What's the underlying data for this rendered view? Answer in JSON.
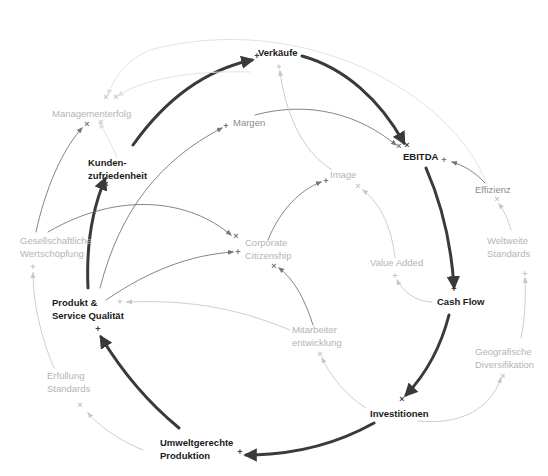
{
  "diagram": {
    "type": "causal-loop-diagram",
    "width": 548,
    "height": 476,
    "colors": {
      "strong": "#3a3a3a",
      "strong_text": "#1a1a1a",
      "medium": "#777777",
      "medium_text": "#8a8a8a",
      "light": "#c8c8c8",
      "light_text": "#b4b4b4",
      "faint": "#e2e2e2"
    },
    "nodes": [
      {
        "id": "verkaeufe",
        "lines": [
          "Verkäufe"
        ],
        "x": 258,
        "y": 56,
        "anchor": "start",
        "weight": "strong"
      },
      {
        "id": "managementerfolg",
        "lines": [
          "Managementerfolg"
        ],
        "x": 52,
        "y": 117,
        "anchor": "start",
        "weight": "light"
      },
      {
        "id": "margen",
        "lines": [
          "Margen"
        ],
        "x": 233,
        "y": 126,
        "anchor": "start",
        "weight": "medium"
      },
      {
        "id": "kundenzufriedenheit",
        "lines": [
          "Kunden-",
          "zufriedenheit"
        ],
        "x": 88,
        "y": 166,
        "anchor": "start",
        "weight": "strong"
      },
      {
        "id": "ebitda",
        "lines": [
          "EBITDA"
        ],
        "x": 403,
        "y": 160,
        "anchor": "start",
        "weight": "strong"
      },
      {
        "id": "image",
        "lines": [
          "Image"
        ],
        "x": 330,
        "y": 178,
        "anchor": "start",
        "weight": "light"
      },
      {
        "id": "effizienz",
        "lines": [
          "Effizienz"
        ],
        "x": 475,
        "y": 193,
        "anchor": "start",
        "weight": "medium"
      },
      {
        "id": "gesellschaftliche",
        "lines": [
          "Gesellschaftliche",
          "Wertschöpfung"
        ],
        "x": 20,
        "y": 244,
        "anchor": "start",
        "weight": "light"
      },
      {
        "id": "corporate",
        "lines": [
          "Corporate",
          "Citizenship"
        ],
        "x": 245,
        "y": 246,
        "anchor": "start",
        "weight": "light"
      },
      {
        "id": "weltweite",
        "lines": [
          "Weltweite",
          "Standards"
        ],
        "x": 487,
        "y": 244,
        "anchor": "start",
        "weight": "light"
      },
      {
        "id": "valueadded",
        "lines": [
          "Value Added"
        ],
        "x": 370,
        "y": 266,
        "anchor": "start",
        "weight": "light"
      },
      {
        "id": "cashflow",
        "lines": [
          "Cash Flow"
        ],
        "x": 437,
        "y": 305,
        "anchor": "start",
        "weight": "strong"
      },
      {
        "id": "produkt",
        "lines": [
          "Produkt &",
          "Service Qualität"
        ],
        "x": 52,
        "y": 306,
        "anchor": "start",
        "weight": "strong"
      },
      {
        "id": "mitarbeiter",
        "lines": [
          "Mitarbeiter",
          "entwicklung"
        ],
        "x": 292,
        "y": 333,
        "anchor": "start",
        "weight": "light"
      },
      {
        "id": "geografische",
        "lines": [
          "Geografische",
          "Diversifikation"
        ],
        "x": 475,
        "y": 355,
        "anchor": "start",
        "weight": "light"
      },
      {
        "id": "erfuellung",
        "lines": [
          "Erfüllung",
          "Standards"
        ],
        "x": 47,
        "y": 379,
        "anchor": "start",
        "weight": "light"
      },
      {
        "id": "investitionen",
        "lines": [
          "Investitionen"
        ],
        "x": 370,
        "y": 417,
        "anchor": "start",
        "weight": "strong"
      },
      {
        "id": "umweltgerechte",
        "lines": [
          "Umweltgerechte",
          "Produktion"
        ],
        "x": 160,
        "y": 446,
        "anchor": "start",
        "weight": "strong"
      }
    ],
    "edges": [
      {
        "from": "kundenzufriedenheit",
        "to": "verkaeufe",
        "weight": "strong",
        "polarity": "+",
        "d": "M133,145 C165,100 205,70 252,60",
        "mx": 257,
        "my": 56
      },
      {
        "from": "verkaeufe",
        "to": "ebitda",
        "weight": "strong",
        "polarity": "×",
        "d": "M302,56 C345,68 380,100 404,143",
        "mx": 407,
        "my": 145
      },
      {
        "from": "ebitda",
        "to": "cashflow",
        "weight": "strong",
        "polarity": "+",
        "d": "M426,168 C440,200 451,240 454,287",
        "mx": 454,
        "my": 289
      },
      {
        "from": "cashflow",
        "to": "investitionen",
        "weight": "strong",
        "polarity": "×",
        "d": "M449,315 C440,350 425,375 406,395",
        "mx": 402,
        "my": 399
      },
      {
        "from": "investitionen",
        "to": "umweltgerechte",
        "weight": "strong",
        "polarity": "+",
        "d": "M374,423 C340,442 300,455 246,455",
        "mx": 240,
        "my": 452
      },
      {
        "from": "umweltgerechte",
        "to": "produkt",
        "weight": "strong",
        "polarity": "+",
        "d": "M179,428 C145,400 118,365 101,337",
        "mx": 98,
        "my": 329
      },
      {
        "from": "produkt",
        "to": "kundenzufriedenheit",
        "weight": "strong",
        "polarity": "×",
        "d": "M88,288 C86,245 92,210 105,179",
        "mx": 106,
        "my": 184
      },
      {
        "from": "produkt",
        "to": "margen",
        "weight": "medium",
        "polarity": "+",
        "d": "M100,288 C120,210 160,160 222,128",
        "mx": 226,
        "my": 126
      },
      {
        "from": "margen",
        "to": "ebitda",
        "weight": "medium",
        "polarity": "×",
        "d": "M255,115 C310,100 360,115 396,145",
        "mx": 399,
        "my": 146
      },
      {
        "from": "produkt",
        "to": "corporate",
        "weight": "medium",
        "polarity": "+",
        "d": "M106,300 C150,270 190,255 233,252",
        "mx": 238,
        "my": 252
      },
      {
        "from": "gesellschaftliche",
        "to": "corporate",
        "weight": "medium",
        "polarity": "×",
        "d": "M48,232 C120,190 190,200 231,235",
        "mx": 236,
        "my": 236
      },
      {
        "from": "corporate",
        "to": "image",
        "weight": "medium",
        "polarity": "+",
        "d": "M268,240 C280,210 300,190 321,182",
        "mx": 326,
        "my": 181
      },
      {
        "from": "mitarbeiter",
        "to": "corporate",
        "weight": "medium",
        "polarity": "×",
        "d": "M313,325 C305,300 295,280 279,268",
        "mx": 274,
        "my": 266
      },
      {
        "from": "mitarbeiter",
        "to": "produkt",
        "weight": "light",
        "polarity": "+",
        "d": "M290,330 C230,305 180,300 127,302",
        "mx": 120,
        "my": 302
      },
      {
        "from": "effizienz",
        "to": "ebitda",
        "weight": "medium",
        "polarity": "+",
        "d": "M485,183 C475,172 463,165 452,162",
        "mx": 444,
        "my": 160
      },
      {
        "from": "weltweite",
        "to": "effizienz",
        "weight": "light",
        "polarity": "×",
        "d": "M511,230 C508,220 505,212 499,204",
        "mx": 497,
        "my": 199
      },
      {
        "from": "geografische",
        "to": "weltweite",
        "weight": "light",
        "polarity": "+",
        "d": "M521,338 C525,320 526,295 525,278",
        "mx": 525,
        "my": 274
      },
      {
        "from": "investitionen",
        "to": "geografische",
        "weight": "light",
        "polarity": "×",
        "d": "M418,421 C460,425 490,410 501,378",
        "mx": 503,
        "my": 376
      },
      {
        "from": "investitionen",
        "to": "mitarbeiter",
        "weight": "light",
        "polarity": "×",
        "d": "M366,408 C345,395 330,375 322,358",
        "mx": 320,
        "my": 354
      },
      {
        "from": "cashflow",
        "to": "valueadded",
        "weight": "light",
        "polarity": "+",
        "d": "M432,302 C415,302 402,290 397,280",
        "mx": 395,
        "my": 276
      },
      {
        "from": "valueadded",
        "to": "image",
        "weight": "light",
        "polarity": "×",
        "d": "M395,258 C392,230 382,205 363,190",
        "mx": 358,
        "my": 186
      },
      {
        "from": "image",
        "to": "verkaeufe",
        "weight": "light",
        "polarity": "+",
        "d": "M332,170 C300,150 285,110 280,71",
        "mx": 279,
        "my": 67
      },
      {
        "from": "kundenzufriedenheit",
        "to": "managementerfolg",
        "weight": "faint",
        "polarity": "×",
        "d": "M117,158 C110,140 103,130 100,123",
        "mx": 101,
        "my": 122
      },
      {
        "from": "verkaeufe",
        "to": "managementerfolg",
        "weight": "faint",
        "polarity": "×",
        "d": "M250,72 C190,70 140,80 118,96",
        "mx": 116,
        "my": 97
      },
      {
        "from": "effizienz",
        "to": "managementerfolg",
        "weight": "faint",
        "polarity": "×",
        "d": "M487,184 C450,90 300,10 150,50 C125,60 113,80 108,95",
        "mx": 106,
        "my": 97
      },
      {
        "from": "gesellschaftliche",
        "to": "managementerfolg",
        "weight": "medium",
        "polarity": "×",
        "d": "M36,232 C45,190 62,150 82,128",
        "mx": 87,
        "my": 124
      },
      {
        "from": "erfuellung",
        "to": "gesellschaftliche",
        "weight": "light",
        "polarity": "+",
        "d": "M54,368 C42,340 33,305 33,273",
        "mx": 33,
        "my": 267
      },
      {
        "from": "umweltgerechte",
        "to": "erfuellung",
        "weight": "light",
        "polarity": "×",
        "d": "M143,450 C118,440 98,425 88,413",
        "mx": 80,
        "my": 405
      }
    ]
  }
}
